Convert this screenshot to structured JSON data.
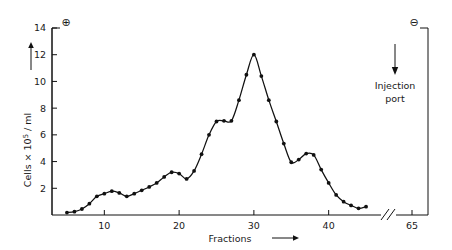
{
  "chart_data": {
    "type": "line",
    "title": "",
    "subtitle": "",
    "xlabel": "Fractions",
    "ylabel": "Cells × 10⁵ / ml",
    "ylabel_prefix": "Cells × 10",
    "ylabel_exponent": "5",
    "ylabel_suffix": " / ml",
    "xlim": [
      3,
      47
    ],
    "ylim": [
      0,
      14
    ],
    "grid": false,
    "legend": null,
    "marker": "filled-circle",
    "line_color": "#111111",
    "marker_color": "#111111",
    "axis_color": "#111111",
    "background_color": "#ffffff",
    "x_ticks": [
      10,
      20,
      30,
      40
    ],
    "x_tick_labels": [
      "10",
      "20",
      "30",
      "40"
    ],
    "x_break_tick": 65,
    "x_break_tick_label": "65",
    "x_break_symbol": "//",
    "y_ticks": [
      2,
      4,
      6,
      8,
      10,
      12,
      14
    ],
    "y_tick_labels": [
      "2",
      "4",
      "6",
      "8",
      "10",
      "12",
      "14"
    ],
    "x": [
      5,
      6,
      7,
      8,
      9,
      10,
      11,
      12,
      13,
      14,
      15,
      16,
      17,
      18,
      19,
      20,
      21,
      22,
      23,
      24,
      25,
      26,
      27,
      28,
      29,
      30,
      31,
      32,
      33,
      34,
      35,
      36,
      37,
      38,
      39,
      40,
      41,
      42,
      43,
      44,
      45
    ],
    "y": [
      0.18,
      0.25,
      0.45,
      0.85,
      1.4,
      1.6,
      1.78,
      1.65,
      1.4,
      1.6,
      1.85,
      2.1,
      2.4,
      2.85,
      3.2,
      3.1,
      2.7,
      3.3,
      4.55,
      6.0,
      7.0,
      7.05,
      7.05,
      8.6,
      10.5,
      12.0,
      10.4,
      8.6,
      7.0,
      5.35,
      3.95,
      4.15,
      4.6,
      4.5,
      3.4,
      2.4,
      1.5,
      1.0,
      0.72,
      0.5,
      0.62
    ],
    "annotations": [
      {
        "name": "anode-symbol",
        "text": "⊕",
        "x": 6.5,
        "y": 13.5
      },
      {
        "name": "cathode-symbol",
        "text": "⊖",
        "x": 63.2,
        "y": 13.5
      },
      {
        "name": "injection-port",
        "text_line1": "Injection",
        "text_line2": "port",
        "x": 65,
        "y": 10.5
      }
    ]
  },
  "labels": {
    "injection_port_line1": "Injection",
    "injection_port_line2": "port",
    "anode": "⊕",
    "cathode": "⊖",
    "x_axis_title": "Fractions",
    "y_axis_prefix": "Cells × 10",
    "y_axis_exponent": "5",
    "y_axis_suffix": " / ml",
    "axis_break": "//"
  }
}
